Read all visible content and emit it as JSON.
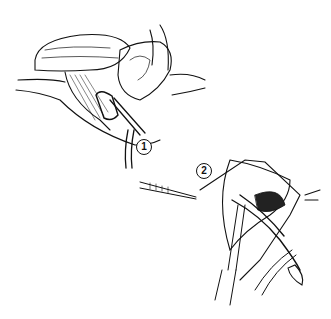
{
  "figure": {
    "type": "surgical line illustration",
    "panels": [
      {
        "id": "panel-1",
        "label": "1",
        "description": "Upper-left view of open surgical field with retracted tissue and clamp/forceps"
      },
      {
        "id": "panel-2",
        "label": "2",
        "description": "Lower-right view of incision with forceps and scalpel/instrument"
      }
    ],
    "colors": {
      "ink": "#111111",
      "background": "#ffffff"
    }
  }
}
